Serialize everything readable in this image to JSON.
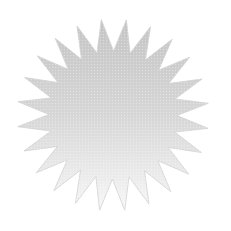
{
  "image": {
    "width": 231,
    "height": 231,
    "background": "#ffffff",
    "subject": "starburst shape"
  },
  "starburst": {
    "center_x": 113,
    "center_y": 115,
    "outer_radius": 96,
    "inner_radius": 64,
    "points": 24,
    "rotation_deg": -7,
    "gradient": {
      "top_color": "#c4c4c4",
      "middle_color": "#d6d6d6",
      "bottom_color": "#f7f7f7"
    },
    "edge_color": "#d0d0d0",
    "texture": "halftone"
  }
}
